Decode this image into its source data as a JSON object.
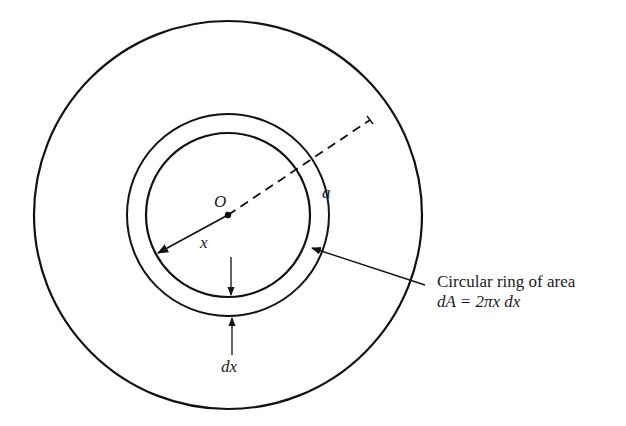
{
  "diagram": {
    "title": "",
    "labels": {
      "center": "O",
      "inner_radius": "x",
      "outer_radius": "a",
      "ring_width": "dx",
      "annotation_line1": "Circular ring of area",
      "annotation_line2": "dA = 2πx dx"
    },
    "geometry": {
      "center": [
        228,
        215
      ],
      "outer_circle_radius": 194,
      "ring_outer_radius": 101,
      "ring_inner_radius": 82
    },
    "colors": {
      "stroke": "#111111",
      "background": "#ffffff"
    }
  }
}
